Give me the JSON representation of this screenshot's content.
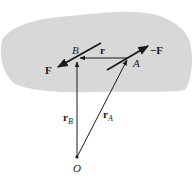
{
  "diagram": {
    "colors": {
      "body_fill": "#d8d8d8",
      "line": "#1a1a1a",
      "background": "#ffffff"
    },
    "points": {
      "B": {
        "label": "B",
        "x": 77,
        "y": 59
      },
      "A": {
        "label": "A",
        "x": 128,
        "y": 58
      },
      "O": {
        "label": "O",
        "x": 77,
        "y": 157
      }
    },
    "vectors": {
      "r": {
        "label": "r",
        "from": "A",
        "to": "B"
      },
      "F": {
        "label": "F",
        "at": "B"
      },
      "negF": {
        "label": "−F",
        "at": "A"
      },
      "rB": {
        "label": "r",
        "subscript": "B",
        "from": "O",
        "to": "B"
      },
      "rA": {
        "label": "r",
        "subscript": "A",
        "from": "O",
        "to": "A"
      }
    }
  }
}
